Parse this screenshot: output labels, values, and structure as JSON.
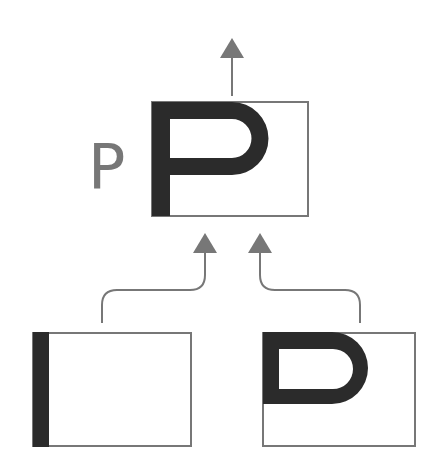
{
  "diagram": {
    "result_label": "P",
    "nodes": [
      {
        "id": "result",
        "content": "P glyph (stem + bowl)",
        "position": "top"
      },
      {
        "id": "stem",
        "content": "vertical stem",
        "position": "bottom-left"
      },
      {
        "id": "bowl",
        "content": "bowl (D shape)",
        "position": "bottom-right"
      }
    ],
    "edges": [
      {
        "from": "stem",
        "to": "result"
      },
      {
        "from": "bowl",
        "to": "result"
      },
      {
        "from": "result",
        "to": "output"
      }
    ],
    "colors": {
      "glyph": "#2b2b2b",
      "box_border": "#777777",
      "arrow": "#777777",
      "label": "#777777"
    }
  }
}
